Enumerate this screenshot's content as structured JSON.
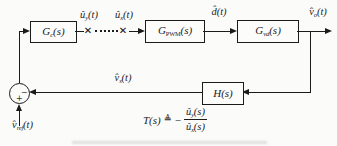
{
  "diagram": {
    "colors": {
      "background": "#fbfbfa",
      "line": "#1b1b1b"
    },
    "blocks": {
      "gc": {
        "name": "G",
        "sub": "c",
        "args": "(s)"
      },
      "gpwm": {
        "name": "G",
        "sub": "PWM",
        "args": "(s)"
      },
      "gvd": {
        "name": "G",
        "sub": "vd",
        "args": "(s)"
      },
      "h": {
        "name": "H",
        "sub": "",
        "args": "(s)"
      }
    },
    "signals": {
      "uy": {
        "main": "û",
        "sub": "y",
        "rest": "(t)"
      },
      "ux": {
        "main": "û",
        "sub": "x",
        "rest": "(t)"
      },
      "d": {
        "main": "d̂",
        "sub": "",
        "rest": "(t)"
      },
      "vo": {
        "main": "v̂",
        "sub": "o",
        "rest": "(t)"
      },
      "vs": {
        "main": "v̂",
        "sub": "s",
        "rest": "(t)"
      },
      "vref": {
        "main": "v̂",
        "sub": "ref",
        "rest": "(t)"
      }
    },
    "summing_junction": {
      "minus": "−",
      "plus": "+"
    },
    "break_marker": "✕",
    "formula": {
      "lhs": "T(s)",
      "def": "≜",
      "minus": "−",
      "num": {
        "main": "û",
        "sub": "y",
        "rest": "(s)"
      },
      "den": {
        "main": "û",
        "sub": "x",
        "rest": "(s)"
      }
    }
  }
}
